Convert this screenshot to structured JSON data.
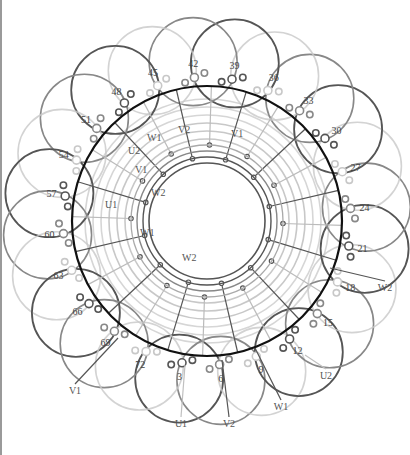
{
  "diagram": {
    "type": "stator-winding-diagram",
    "slot_labels": [
      "3",
      "6",
      "9",
      "12",
      "15",
      "18",
      "21",
      "24",
      "27",
      "30",
      "33",
      "36",
      "39",
      "42",
      "45",
      "48",
      "51",
      "54",
      "57",
      "60",
      "63",
      "66",
      "69",
      "72"
    ],
    "inner_terminals": [
      {
        "label": "V2",
        "x": 178,
        "y": 133
      },
      {
        "label": "W1",
        "x": 147,
        "y": 141
      },
      {
        "label": "V1",
        "x": 231,
        "y": 137
      },
      {
        "label": "U2",
        "x": 128,
        "y": 154
      },
      {
        "label": "V1",
        "x": 135,
        "y": 173
      },
      {
        "label": "W2",
        "x": 151,
        "y": 196
      },
      {
        "label": "U1",
        "x": 105,
        "y": 208
      },
      {
        "label": "W1",
        "x": 140,
        "y": 236
      },
      {
        "label": "W2",
        "x": 182,
        "y": 261
      }
    ],
    "outer_leads": [
      {
        "label": "W2",
        "x": 385,
        "y": 291
      },
      {
        "label": "U2",
        "x": 326,
        "y": 379
      },
      {
        "label": "W1",
        "x": 281,
        "y": 410
      },
      {
        "label": "V1",
        "x": 75,
        "y": 394
      },
      {
        "label": "U1",
        "x": 181,
        "y": 427
      },
      {
        "label": "V2",
        "x": 229,
        "y": 427
      }
    ],
    "colors": {
      "main_ring": "#111111",
      "phase_dark": "#555555",
      "phase_mid": "#888888",
      "phase_light": "#c8c8c8",
      "text": "#444444"
    }
  }
}
